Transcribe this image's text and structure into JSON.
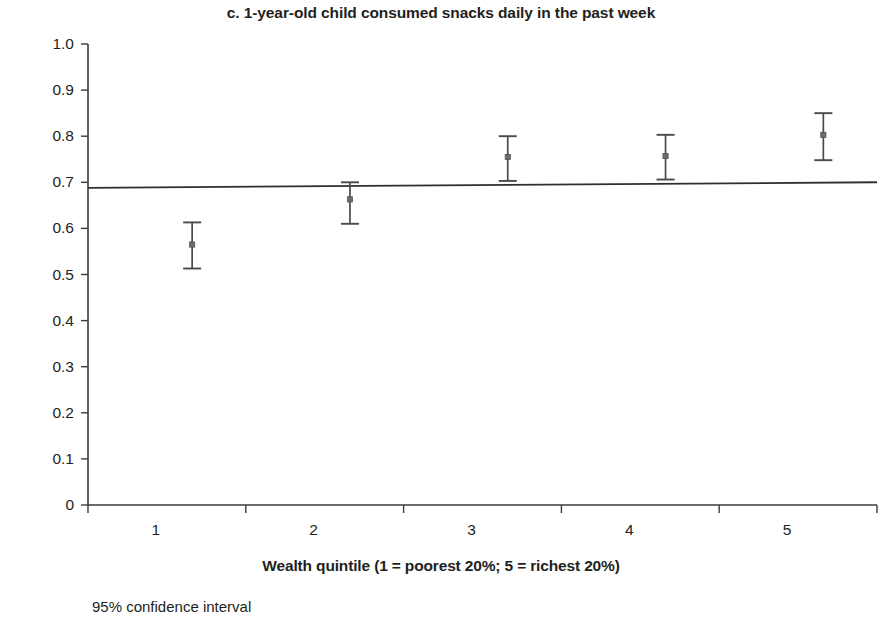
{
  "chart_data": {
    "type": "scatter",
    "title": "c. 1-year-old child consumed snacks daily in the past week",
    "xlabel": "Wealth quintile (1 = poorest 20%; 5 = richest 20%)",
    "ylabel": "Proportion",
    "footnote": "95% confidence interval",
    "grid": false,
    "legend": null,
    "xlim": [
      0.5,
      5.5
    ],
    "ylim": [
      0,
      1.0
    ],
    "categories": [
      "1",
      "2",
      "3",
      "4",
      "5"
    ],
    "x": [
      1,
      2,
      3,
      4,
      5
    ],
    "values": [
      0.565,
      0.663,
      0.755,
      0.757,
      0.803
    ],
    "ci_low": [
      0.513,
      0.61,
      0.703,
      0.706,
      0.748
    ],
    "ci_high": [
      0.613,
      0.7,
      0.8,
      0.803,
      0.85
    ],
    "error_bar_label": "95% confidence interval",
    "ytick_labels": [
      "1.0",
      "0.9",
      "0.8",
      "0.7",
      "0.6",
      "0.5",
      "0.4",
      "0.3",
      "0.2",
      "0.1",
      "0"
    ],
    "ytick_values": [
      1.0,
      0.9,
      0.8,
      0.7,
      0.6,
      0.5,
      0.4,
      0.3,
      0.2,
      0.1,
      0
    ],
    "xtick_labels": [
      "1",
      "2",
      "3",
      "4",
      "5"
    ],
    "reference_line": {
      "name": "fitted line",
      "y_start": 0.688,
      "y_end": 0.7
    }
  }
}
